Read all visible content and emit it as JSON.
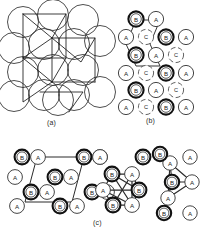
{
  "figure": {
    "title_visible": false,
    "panels": [
      {
        "id": "a",
        "caption": "(a)",
        "caption_x": 47,
        "caption_y": 119
      },
      {
        "id": "b",
        "caption": "(b)",
        "caption_x": 146,
        "caption_y": 117
      },
      {
        "id": "c",
        "caption": "(c)",
        "caption_x": 93,
        "caption_y": 219
      }
    ]
  },
  "colors": {
    "ink": "#1a1a1a",
    "outline_thin": "#3a3a3a",
    "outline_thick": "#111111",
    "dashed": "#5a5a5a",
    "paper": "#ffffff",
    "bond": "#2b2b2b"
  },
  "legend_symbols": {
    "A": "thin-outline-circle",
    "B": "thick-double-outline-circle",
    "C": "dashed-broken-outline-circle"
  },
  "panel_a": {
    "kind": "close-packed-spheres-with-unit-cell-lines",
    "sphere_radius": 15.5,
    "spheres": [
      {
        "cx": 23,
        "cy": 22
      },
      {
        "cx": 53,
        "cy": 15
      },
      {
        "cx": 83,
        "cy": 20
      },
      {
        "cx": 14,
        "cy": 48
      },
      {
        "cx": 44,
        "cy": 44
      },
      {
        "cx": 74,
        "cy": 44
      },
      {
        "cx": 100,
        "cy": 41
      },
      {
        "cx": 23,
        "cy": 72
      },
      {
        "cx": 53,
        "cy": 70
      },
      {
        "cx": 83,
        "cy": 70
      },
      {
        "cx": 14,
        "cy": 96
      },
      {
        "cx": 44,
        "cy": 95
      },
      {
        "cx": 74,
        "cy": 95
      },
      {
        "cx": 100,
        "cy": 92
      },
      {
        "cx": 58,
        "cy": 100
      }
    ],
    "polyline_paths": [
      "M 23,14 L 66,14 L 52,38 L 23,14",
      "M 23,14 L 23,58 L 52,38",
      "M 23,58 L 66,58 L 52,82 L 23,58",
      "M 66,14 L 66,58",
      "M 52,38 L 95,38 L 81,62 L 52,38",
      "M 95,38 L 95,82",
      "M 52,82 L 95,82",
      "M 23,58 L 23,102 L 52,82",
      "M 52,82 L 52,38",
      "M 40,92 L 83,92 L 69,112"
    ]
  },
  "panel_b": {
    "kind": "abc-stacking-site-lattice",
    "cell_path": "M 136,20 L 160,20 L 150,44 L 160,66 L 136,66 L 126,44 Z",
    "nodes": [
      {
        "label": "B",
        "type": "B",
        "cx": 136,
        "cy": 19
      },
      {
        "label": "A",
        "type": "A",
        "cx": 156,
        "cy": 19
      },
      {
        "label": "A",
        "type": "A",
        "cx": 126,
        "cy": 37
      },
      {
        "label": "C",
        "type": "C",
        "cx": 146,
        "cy": 37
      },
      {
        "label": "B",
        "type": "B",
        "cx": 166,
        "cy": 37
      },
      {
        "label": "A",
        "type": "A",
        "cx": 186,
        "cy": 37
      },
      {
        "label": "B",
        "type": "B",
        "cx": 136,
        "cy": 55
      },
      {
        "label": "A",
        "type": "A",
        "cx": 156,
        "cy": 55
      },
      {
        "label": "C",
        "type": "C",
        "cx": 176,
        "cy": 55
      },
      {
        "label": "A",
        "type": "A",
        "cx": 126,
        "cy": 73
      },
      {
        "label": "C",
        "type": "C",
        "cx": 146,
        "cy": 73
      },
      {
        "label": "B",
        "type": "B",
        "cx": 166,
        "cy": 73
      },
      {
        "label": "A",
        "type": "A",
        "cx": 186,
        "cy": 73
      },
      {
        "label": "B",
        "type": "B",
        "cx": 136,
        "cy": 90
      },
      {
        "label": "A",
        "type": "A",
        "cx": 156,
        "cy": 90
      },
      {
        "label": "C",
        "type": "C",
        "cx": 176,
        "cy": 90
      },
      {
        "label": "A",
        "type": "A",
        "cx": 126,
        "cy": 107
      },
      {
        "label": "C",
        "type": "C",
        "cx": 146,
        "cy": 107
      },
      {
        "label": "B",
        "type": "B",
        "cx": 166,
        "cy": 107
      },
      {
        "label": "A",
        "type": "A",
        "cx": 186,
        "cy": 107
      }
    ],
    "node_radius": 7.6
  },
  "panel_c": {
    "kind": "coordination-clusters",
    "left_group": {
      "name": "unit-cell-lattice",
      "cell_path": "M 37,157 L 84,157 L 72,202 L 25,202 Z",
      "nodes": [
        {
          "label": "B",
          "type": "B",
          "cx": 22,
          "cy": 157
        },
        {
          "label": "A",
          "type": "A",
          "cx": 38,
          "cy": 157
        },
        {
          "label": "B",
          "type": "B",
          "cx": 84,
          "cy": 157
        },
        {
          "label": "A",
          "type": "A",
          "cx": 100,
          "cy": 157
        },
        {
          "label": "A",
          "type": "A",
          "cx": 15,
          "cy": 177
        },
        {
          "label": "B",
          "type": "B",
          "cx": 55,
          "cy": 177
        },
        {
          "label": "A",
          "type": "A",
          "cx": 71,
          "cy": 177
        },
        {
          "label": "B",
          "type": "B",
          "cx": 31,
          "cy": 192
        },
        {
          "label": "A",
          "type": "A",
          "cx": 47,
          "cy": 192
        },
        {
          "label": "B",
          "type": "B",
          "cx": 92,
          "cy": 192
        },
        {
          "label": "A",
          "type": "A",
          "cx": 107,
          "cy": 192
        },
        {
          "label": "A",
          "type": "A",
          "cx": 17,
          "cy": 206
        },
        {
          "label": "B",
          "type": "B",
          "cx": 60,
          "cy": 206
        },
        {
          "label": "A",
          "type": "A",
          "cx": 77,
          "cy": 206
        }
      ]
    },
    "middle_group": {
      "name": "octahedral-ring-cluster",
      "nodes": [
        {
          "label": "B",
          "type": "B",
          "cx": 112,
          "cy": 174
        },
        {
          "label": "A",
          "type": "A",
          "cx": 132,
          "cy": 174
        },
        {
          "label": "A",
          "type": "A",
          "cx": 103,
          "cy": 190
        },
        {
          "label": "B",
          "type": "B",
          "cx": 139,
          "cy": 190
        },
        {
          "label": "B",
          "type": "B",
          "cx": 113,
          "cy": 205
        },
        {
          "label": "A",
          "type": "A",
          "cx": 132,
          "cy": 205
        }
      ],
      "bonds": [
        [
          0,
          1
        ],
        [
          1,
          3
        ],
        [
          3,
          5
        ],
        [
          5,
          4
        ],
        [
          4,
          2
        ],
        [
          2,
          0
        ],
        [
          0,
          5
        ],
        [
          0,
          3
        ],
        [
          1,
          5
        ],
        [
          2,
          5
        ],
        [
          2,
          3
        ],
        [
          1,
          4
        ]
      ]
    },
    "right_group": {
      "name": "tetrahedral-cluster",
      "nodes": [
        {
          "label": "A",
          "type": "A",
          "cx": 170,
          "cy": 163
        },
        {
          "label": "B",
          "type": "B",
          "cx": 172,
          "cy": 182
        },
        {
          "label": "A",
          "type": "A",
          "cx": 192,
          "cy": 182
        },
        {
          "label": "A",
          "type": "A",
          "cx": 168,
          "cy": 198
        }
      ],
      "bonds": [
        [
          0,
          1
        ],
        [
          0,
          2
        ],
        [
          0,
          3
        ],
        [
          1,
          2
        ],
        [
          1,
          3
        ],
        [
          2,
          3
        ]
      ],
      "extra_nodes": [
        {
          "label": "B",
          "type": "B",
          "cx": 160,
          "cy": 154
        },
        {
          "label": "A",
          "type": "A",
          "cx": 190,
          "cy": 157
        },
        {
          "label": "B",
          "type": "B",
          "cx": 164,
          "cy": 213
        },
        {
          "label": "A",
          "type": "A",
          "cx": 190,
          "cy": 213
        }
      ]
    },
    "stray_nodes": [
      {
        "label": "A",
        "type": "A",
        "cx": 100,
        "cy": 157
      },
      {
        "label": "B",
        "type": "B",
        "cx": 143,
        "cy": 157
      }
    ]
  }
}
